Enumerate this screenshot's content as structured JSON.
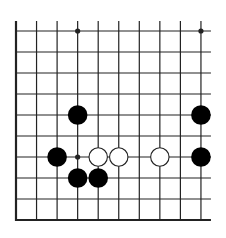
{
  "diagram": {
    "type": "go-board-fragment",
    "grid": {
      "columns": 10,
      "rows": 10,
      "origin_x": 16,
      "origin_y": 31,
      "spacing_x": 20.55,
      "spacing_y": 21,
      "line_color": "#222222",
      "edges": {
        "left": true,
        "bottom": true,
        "top": false,
        "right": false
      }
    },
    "star_points": [
      {
        "col": 3,
        "row": 0
      },
      {
        "col": 9,
        "row": 0
      },
      {
        "col": 3,
        "row": 6
      }
    ],
    "stones": [
      {
        "color": "black",
        "col": 3,
        "row": 4
      },
      {
        "color": "black",
        "col": 9,
        "row": 4
      },
      {
        "color": "black",
        "col": 2,
        "row": 6
      },
      {
        "color": "white",
        "col": 4,
        "row": 6
      },
      {
        "color": "white",
        "col": 5,
        "row": 6
      },
      {
        "color": "white",
        "col": 7,
        "row": 6
      },
      {
        "color": "black",
        "col": 9,
        "row": 6
      },
      {
        "color": "black",
        "col": 3,
        "row": 7
      },
      {
        "color": "black",
        "col": 4,
        "row": 7
      }
    ],
    "colors": {
      "black_stone": "#000000",
      "white_stone": "#ffffff",
      "white_outline": "#222222",
      "background": "#ffffff"
    }
  }
}
